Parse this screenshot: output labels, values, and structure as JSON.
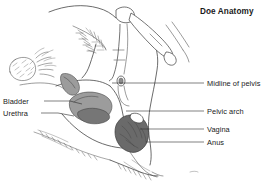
{
  "figure": {
    "title": "Doe Anatomy",
    "background_color": "#ffffff",
    "line_color": "#3a3a3a",
    "text_color": "#1a1a1a"
  },
  "labels_left": [
    {
      "id": "bladder",
      "text": "Bladder",
      "text_x": 3,
      "text_y": 104,
      "leader": "M44,101 L70,101 L82,104"
    },
    {
      "id": "urethra",
      "text": "Urethra",
      "text_x": 3,
      "text_y": 116,
      "leader": "M41,113 L58,113 L74,116"
    }
  ],
  "labels_right": [
    {
      "id": "midline-of-pelvis",
      "text": "Midline of pelvis",
      "text_x": 207,
      "text_y": 86,
      "leader": "M204,83 L112,83"
    },
    {
      "id": "pelvic-arch",
      "text": "Pelvic arch",
      "text_x": 207,
      "text_y": 114,
      "leader": "M204,111 L126,111"
    },
    {
      "id": "vagina",
      "text": "Vagina",
      "text_x": 207,
      "text_y": 132,
      "leader": "M204,129 L140,129"
    },
    {
      "id": "anus",
      "text": "Anus",
      "text_x": 207,
      "text_y": 145,
      "leader": "M204,142 L146,142"
    }
  ],
  "organ_shapes": [
    {
      "id": "urethra-organ",
      "fill": "#9c9c9c",
      "tone": "mid"
    },
    {
      "id": "bladder-organ",
      "fill": "#9c9c9c",
      "tone": "mid"
    },
    {
      "id": "bladder-lower-lobe",
      "fill": "#767676",
      "tone": "dark"
    },
    {
      "id": "vaginal-anal-mass",
      "fill": "#6a6a6a",
      "tone": "darkest"
    }
  ],
  "regions": [
    {
      "id": "tail-head-tuft",
      "kind": "hatched-fur-triangle"
    },
    {
      "id": "udder",
      "kind": "stippled-round-form"
    },
    {
      "id": "hind-leg",
      "kind": "outline-with-hair"
    },
    {
      "id": "spine-and-femur",
      "kind": "bone-outline"
    }
  ]
}
